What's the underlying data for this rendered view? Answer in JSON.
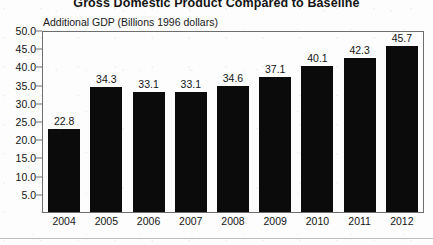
{
  "chart_data": {
    "type": "bar",
    "title": "Gross Domestic Product Compared to Baseline",
    "subtitle": "Additional GDP (Billions 1996 dollars)",
    "xlabel": "",
    "ylabel": "Additional GDP (Billions 1996 dollars)",
    "categories": [
      "2004",
      "2005",
      "2006",
      "2007",
      "2008",
      "2009",
      "2010",
      "2011",
      "2012"
    ],
    "values": [
      22.8,
      34.3,
      33.1,
      33.1,
      34.6,
      37.1,
      40.1,
      42.3,
      45.7
    ],
    "data_labels": [
      "22.8",
      "34.3",
      "33.1",
      "33.1",
      "34.6",
      "37.1",
      "40.1",
      "42.3",
      "45.7"
    ],
    "ylim": [
      0,
      50
    ],
    "ytick_values": [
      50.0,
      45.0,
      40.0,
      35.0,
      30.0,
      25.0,
      20.0,
      15.0,
      10.0,
      5.0
    ],
    "ytick_labels": [
      "50.0",
      "45.0",
      "40.0",
      "35.0",
      "30.0",
      "25.0",
      "20.0",
      "15.0",
      "10.0",
      "5.0"
    ],
    "grid": false,
    "legend": null,
    "bar_color": "#0b0b0b",
    "axis_color": "#6e6e6e",
    "background_color": "#fdfdfd"
  }
}
